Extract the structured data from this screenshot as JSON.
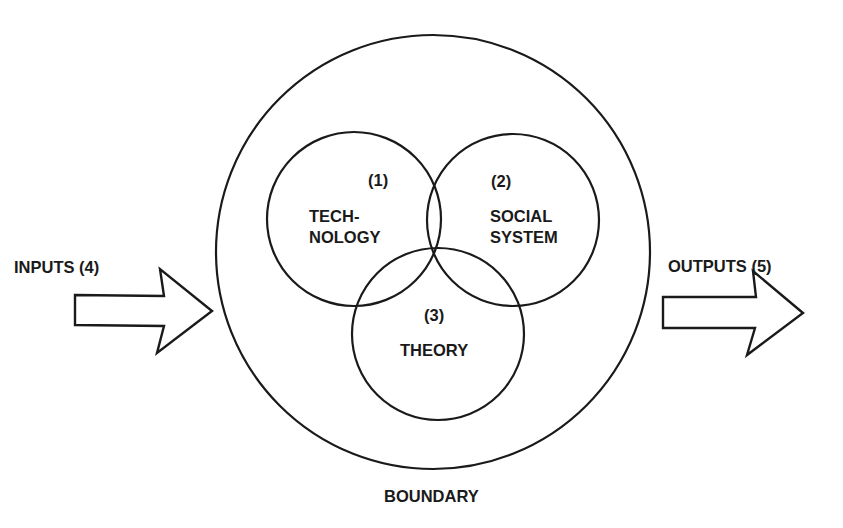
{
  "diagram": {
    "boundary": {
      "label": "BOUNDARY"
    },
    "circles": [
      {
        "number": "(1)",
        "line1": "TECH-",
        "line2": "NOLOGY"
      },
      {
        "number": "(2)",
        "line1": "SOCIAL",
        "line2": "SYSTEM"
      },
      {
        "number": "(3)",
        "line1": "THEORY"
      }
    ],
    "inputs": {
      "label": "INPUTS (4)"
    },
    "outputs": {
      "label": "OUTPUTS (5)"
    },
    "colors": {
      "stroke": "#1a1a1a",
      "background": "#ffffff"
    }
  }
}
